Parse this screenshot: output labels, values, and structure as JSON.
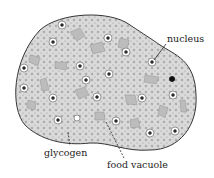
{
  "diagram": {
    "labels": {
      "nucleus": "nucleus",
      "glycogen": "glycogen",
      "food_vacuole": "food vacuole"
    },
    "colors": {
      "cell_fill": "#d8d8d8",
      "outline": "#333333",
      "text": "#222222",
      "background": "#ffffff"
    }
  }
}
